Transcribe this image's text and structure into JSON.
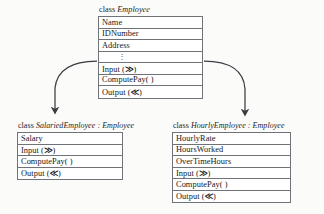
{
  "diagram": {
    "type": "uml-class-diagram",
    "background_color": "#fbfbfa",
    "border_color": "#6f7276",
    "text_color": "#17181a",
    "arrow_color": "#3a3c40"
  },
  "classes": [
    {
      "id": "employee",
      "keyword": "class",
      "name": "Employee",
      "header": "class Employee",
      "base": "",
      "members": [
        {
          "label": "Name",
          "kind": "attribute"
        },
        {
          "label": "IDNumber",
          "kind": "attribute"
        },
        {
          "label": "Address",
          "kind": "attribute"
        },
        {
          "label": "⋮",
          "kind": "ellipsis"
        },
        {
          "label": "Input (≫)",
          "kind": "operation"
        },
        {
          "label": "ComputePay( )",
          "kind": "operation"
        },
        {
          "label": "Output (≪)",
          "kind": "operation"
        }
      ]
    },
    {
      "id": "salaried",
      "keyword": "class",
      "name": "SalariedEmployee",
      "base": "Employee",
      "header": "class SalariedEmployee : Employee",
      "members": [
        {
          "label": "Salary",
          "kind": "attribute"
        },
        {
          "label": "Input (≫)",
          "kind": "operation"
        },
        {
          "label": "ComputePay( )",
          "kind": "operation"
        },
        {
          "label": "Output (≪)",
          "kind": "operation"
        }
      ]
    },
    {
      "id": "hourly",
      "keyword": "class",
      "name": "HourlyEmployee",
      "base": "Employee",
      "header": "class HourlyEmployee : Employee",
      "members": [
        {
          "label": "HourlyRate",
          "kind": "attribute"
        },
        {
          "label": "HoursWorked",
          "kind": "attribute"
        },
        {
          "label": "OverTimeHours",
          "kind": "attribute"
        },
        {
          "label": "Input (≫)",
          "kind": "operation"
        },
        {
          "label": "ComputePay( )",
          "kind": "operation"
        },
        {
          "label": "Output (≪)",
          "kind": "operation"
        }
      ]
    }
  ],
  "relations": [
    {
      "id": "employee-to-salaried",
      "from": "Employee",
      "to": "SalariedEmployee",
      "kind": "inheritance-arrow"
    },
    {
      "id": "employee-to-hourly",
      "from": "Employee",
      "to": "HourlyEmployee",
      "kind": "inheritance-arrow"
    }
  ]
}
